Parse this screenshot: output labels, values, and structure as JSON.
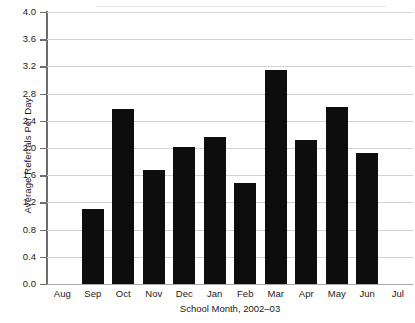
{
  "chart_data": {
    "type": "bar",
    "title": "",
    "subtitle": "",
    "xlabel": "School Month, 2002–03",
    "ylabel": "Average Referrals Per Day",
    "categories": [
      "Aug",
      "Sep",
      "Oct",
      "Nov",
      "Dec",
      "Jan",
      "Feb",
      "Mar",
      "Apr",
      "May",
      "Jun",
      "Jul"
    ],
    "values": [
      0,
      1.11,
      2.57,
      1.67,
      2.01,
      2.16,
      1.48,
      3.14,
      2.12,
      2.6,
      1.92,
      0
    ],
    "ylim": [
      0.0,
      4.0
    ],
    "ytick_step": 0.4,
    "ytick_labels": [
      "4.0",
      "3.6",
      "3.2",
      "2.8",
      "2.4",
      "2.0",
      "1.6",
      "1.2",
      "0.8",
      "0.4",
      "0.0"
    ],
    "ytick_values": [
      4.0,
      3.6,
      3.2,
      2.8,
      2.4,
      2.0,
      1.6,
      1.2,
      0.8,
      0.4,
      0.0
    ],
    "grid": true,
    "grid_axis": "y",
    "legend": false,
    "legend_position": "none",
    "bar_color": "#0d0d0d",
    "grid_color": "#d2d2d2",
    "axis_color": "#6d6d6d",
    "background_color": "#ffffff",
    "annotations": []
  }
}
